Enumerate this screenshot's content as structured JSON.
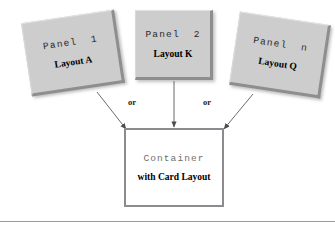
{
  "diagram": {
    "panels": [
      {
        "title": "Panel  1",
        "subtitle": "Layout A"
      },
      {
        "title": "Panel  2",
        "subtitle": "Layout K"
      },
      {
        "title": "Panel  n",
        "subtitle": "Layout Q"
      }
    ],
    "container": {
      "title": "Container",
      "subtitle": "with Card Layout"
    },
    "connectors": [
      {
        "from": "Panel 1",
        "to": "Container",
        "label": ""
      },
      {
        "from": "Panel 2",
        "to": "Container",
        "label": "or"
      },
      {
        "from": "Panel n",
        "to": "Container",
        "label": "or"
      }
    ],
    "or_labels": {
      "left": "or",
      "right": "or"
    },
    "colors": {
      "panel_fill": "#cdcdcd",
      "panel_edge": "#8e8e8e",
      "container_border": "#8d8a90",
      "container_fill": "#ffffff",
      "arrow": "#5a5a5a",
      "container_title_text": "#6f6f6f",
      "body_text": "#000000",
      "rule": "#9a9a9a"
    }
  }
}
